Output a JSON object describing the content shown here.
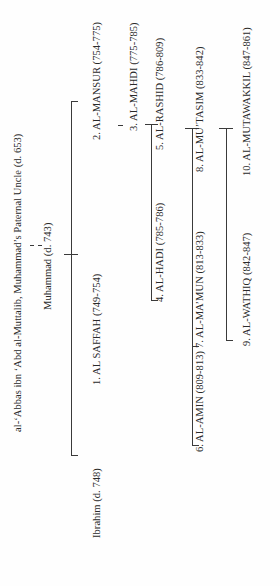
{
  "diagram": {
    "orientation": "rotated-90-ccw",
    "ancestors": {
      "root": "al-‘Abbas ibn ‘Abd al-Muttalib, Muhammad’s Paternal Uncle (d. 653)",
      "descendant_marker": "- -",
      "father": "Muhammad (d. 743)"
    },
    "persons": [
      {
        "id": "ibrahim",
        "label": "Ibrahim (d. 748)"
      },
      {
        "id": "saffah",
        "label": "1. AL SAFFAH (749-754)"
      },
      {
        "id": "mansur",
        "label": "2. AL-MANSUR (754-775)"
      },
      {
        "id": "mahdi",
        "label": "3. AL-MAHDI (775-785)"
      },
      {
        "id": "hadi",
        "label": "4. AL-HADI (785-786)"
      },
      {
        "id": "rashid",
        "label": "5. AL-RASHID (786-809)"
      },
      {
        "id": "amin",
        "label": "6. AL-AMIN (809-813)"
      },
      {
        "id": "mamun",
        "label": "7. AL-MA’MUN (813-833)"
      },
      {
        "id": "mutasim",
        "label": "8. AL-MU’TASIM (833-842)"
      },
      {
        "id": "wathiq",
        "label": "9. AL-WATHIQ (842-847)"
      },
      {
        "id": "mutawakkil",
        "label": "10. AL-MUTAWAKKIL (847-861)"
      }
    ],
    "relations": [
      {
        "parent": "al-‘Abbas",
        "child": "Muhammad (d. 743)",
        "type": "descendant"
      },
      {
        "parent": "Muhammad (d. 743)",
        "children": [
          "Ibrahim (d. 748)",
          "1. AL SAFFAH (749-754)",
          "2. AL-MANSUR (754-775)"
        ]
      },
      {
        "parent": "2. AL-MANSUR (754-775)",
        "children": [
          "3. AL-MAHDI (775-785)"
        ]
      },
      {
        "parent": "3. AL-MAHDI (775-785)",
        "children": [
          "4. AL-HADI (785-786)",
          "5. AL-RASHID (786-809)"
        ]
      },
      {
        "parent": "5. AL-RASHID (786-809)",
        "children": [
          "6. AL-AMIN (809-813)",
          "7. AL-MA’MUN (813-833)",
          "8. AL-MU’TASIM (833-842)"
        ]
      },
      {
        "parent": "8. AL-MU’TASIM (833-842)",
        "children": [
          "9. AL-WATHIQ (842-847)",
          "10. AL-MUTAWAKKIL (847-861)"
        ]
      }
    ],
    "colors": {
      "background": "#fefefe",
      "text": "#2a2a2a",
      "lines": "#3a3a3a"
    }
  }
}
